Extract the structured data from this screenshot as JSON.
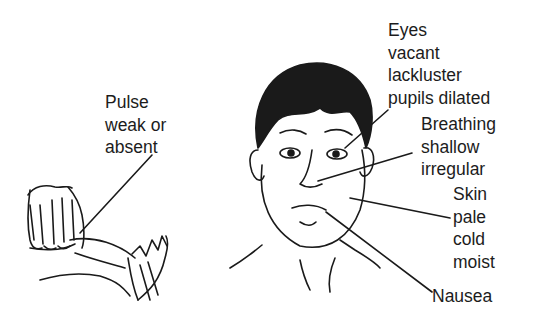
{
  "diagram": {
    "illustrations": [
      {
        "id": "hands",
        "description": "Hand taking pulse at wrist"
      },
      {
        "id": "face",
        "description": "Face of patient in shock"
      }
    ],
    "labels": {
      "pulse": {
        "lines": [
          "Pulse",
          "weak or",
          "absent"
        ]
      },
      "eyes": {
        "lines": [
          "Eyes",
          "vacant",
          "lackluster",
          "pupils dilated"
        ]
      },
      "breathing": {
        "lines": [
          "Breathing",
          "shallow",
          "irregular"
        ]
      },
      "skin": {
        "lines": [
          "Skin",
          "pale",
          "cold",
          "moist"
        ]
      },
      "nausea": {
        "lines": [
          "Nausea"
        ]
      }
    },
    "colors": {
      "ink": "#1a1a1a",
      "background": "#ffffff"
    }
  }
}
